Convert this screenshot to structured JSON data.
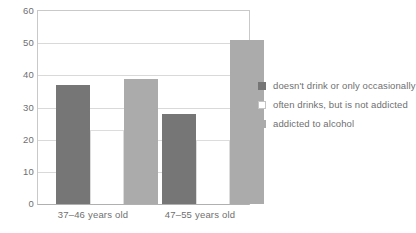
{
  "chart_data": {
    "type": "bar",
    "title": "",
    "subtitle": "",
    "xlabel": "",
    "ylabel": "",
    "categories": [
      "37–46 years old",
      "47–55 years old"
    ],
    "series": [
      {
        "name": "doesn't drink or only occasionally",
        "values": [
          37,
          28
        ],
        "color": "#767676"
      },
      {
        "name": "often drinks, but is not addicted",
        "values": [
          23,
          20
        ],
        "color": "#ffffff"
      },
      {
        "name": "addicted to alcohol",
        "values": [
          39,
          51
        ],
        "color": "#ababab"
      }
    ],
    "ylim": [
      0,
      60
    ],
    "yticks": [
      0,
      10,
      20,
      30,
      40,
      50,
      60
    ],
    "ytick_labels": [
      "0",
      "10",
      "20",
      "30",
      "40",
      "50",
      "60"
    ],
    "grid": "horizontal",
    "legend_position": "right"
  }
}
